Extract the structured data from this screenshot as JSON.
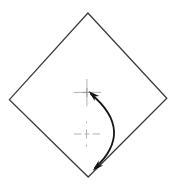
{
  "figure": {
    "colors": {
      "background": "#ffffff",
      "outline": "#3c3c3c",
      "arrow": "#161616",
      "crosshair": "#b2b2b2",
      "crosshair_center": "#969696"
    },
    "diamond": {
      "path": "M 87.9 13 L 166.8 98.2 L 88.2 177 L 9.4 99.6 Z"
    },
    "pivot_crosshair": {
      "cross_path": "M 73.5 92.4 H 101.2 M 86.9 79 V 106.2",
      "center_path": "M 82.5 92.4 H 91.3 M 86.9 88 V 96.8",
      "center_x": 87,
      "center_y": 92
    },
    "center_mark": {
      "h_path": "M 74 134 H 100",
      "v_path": "M 86.5 121.5 V 146.5",
      "center_x": 86.5,
      "center_y": 134
    },
    "rotation_arrow": {
      "arc_path": "M 91 94 Q 135 131 95 168",
      "head_top_points": "88.8,91.2 99.2,96.1 94.7,96.6 94.7,101.1",
      "head_bottom_points": "92.8,170.6 98.6,160.6 98.7,165.2 103.2,165.6"
    }
  }
}
